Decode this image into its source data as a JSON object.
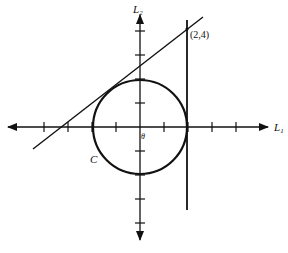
{
  "figure": {
    "axes": {
      "x_label": "L",
      "x_subscript": "1",
      "y_label": "L",
      "y_subscript": "2",
      "origin_label": "θ"
    },
    "curve_label": "C",
    "point_label": "(2,4)",
    "colors": {
      "ink": "#111111",
      "background": "#ffffff"
    }
  },
  "diagram_data": {
    "type": "geometry",
    "unit_ticks_x": [
      -4,
      -3,
      -2,
      -1,
      1,
      2,
      3,
      4
    ],
    "unit_ticks_y": [
      -4,
      -3,
      -2,
      -1,
      1,
      2,
      3,
      4
    ],
    "circle": {
      "label": "C",
      "center": [
        0,
        0
      ],
      "radius": 2
    },
    "vertical_line": {
      "x": 2,
      "passes_through": [
        2,
        4
      ]
    },
    "tangent_line": {
      "passes_through": [
        2,
        4
      ],
      "tangent_to": "C"
    },
    "marked_point": {
      "label": "(2,4)",
      "coords": [
        2,
        4
      ]
    }
  }
}
